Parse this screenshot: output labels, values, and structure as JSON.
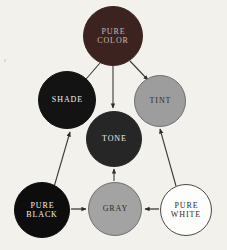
{
  "diagram": {
    "background_color": "#f3f1ec",
    "margin_mark": "r",
    "nodes": [
      {
        "id": "pure-color",
        "label": "PURE\nCOLOR",
        "fill": "#3c2320",
        "text_color": "#c8b8b0",
        "stroke": "#3c2320",
        "cx": 113,
        "cy": 36,
        "r": 30
      },
      {
        "id": "shade",
        "label": "SHADE",
        "fill": "#131313",
        "text_color": "#efefef",
        "stroke": "#131313",
        "cx": 67,
        "cy": 100,
        "r": 29
      },
      {
        "id": "tint",
        "label": "TINT",
        "fill": "#9d9d9d",
        "text_color": "#2b2b2b",
        "stroke": "#6f6f6f",
        "cx": 160,
        "cy": 101,
        "r": 26
      },
      {
        "id": "tone",
        "label": "TONE",
        "fill": "#262626",
        "text_color": "#efefef",
        "stroke": "#262626",
        "cx": 114,
        "cy": 139,
        "r": 28
      },
      {
        "id": "pure-black",
        "label": "PURE\nBLACK",
        "fill": "#0d0d0d",
        "text_color": "#f2f2f2",
        "stroke": "#0d0d0d",
        "cx": 42,
        "cy": 210,
        "r": 28
      },
      {
        "id": "gray",
        "label": "GRAY",
        "fill": "#a3a3a3",
        "text_color": "#2b2b2b",
        "stroke": "#6f6f6f",
        "cx": 115,
        "cy": 209,
        "r": 27
      },
      {
        "id": "pure-white",
        "label": "PURE\nWHITE",
        "fill": "#fdfdfb",
        "text_color": "#2b2b2b",
        "stroke": "#4a4a4a",
        "cx": 186,
        "cy": 210,
        "r": 26
      }
    ],
    "edges": [
      {
        "id": "pure-color-to-shade",
        "from": "pure-color",
        "to": "shade",
        "x1": 100,
        "y1": 63,
        "x2": 80,
        "y2": 86,
        "color": "#3a3a3a"
      },
      {
        "id": "pure-color-to-tone",
        "from": "pure-color",
        "to": "tone",
        "x1": 113,
        "y1": 66,
        "x2": 113,
        "y2": 108,
        "color": "#3a3a3a"
      },
      {
        "id": "pure-color-to-tint",
        "from": "pure-color",
        "to": "tint",
        "x1": 130,
        "y1": 61,
        "x2": 148,
        "y2": 80,
        "color": "#3a3a3a"
      },
      {
        "id": "pure-black-to-shade",
        "from": "pure-black",
        "to": "shade",
        "x1": 54,
        "y1": 187,
        "x2": 70,
        "y2": 132,
        "color": "#3a3a3a"
      },
      {
        "id": "gray-to-tone",
        "from": "gray",
        "to": "tone",
        "x1": 114,
        "y1": 181,
        "x2": 114,
        "y2": 169,
        "color": "#3a3a3a"
      },
      {
        "id": "pure-white-to-tint",
        "from": "pure-white",
        "to": "tint",
        "x1": 176,
        "y1": 186,
        "x2": 160,
        "y2": 129,
        "color": "#3a3a3a"
      },
      {
        "id": "pure-black-to-gray",
        "from": "pure-black",
        "to": "gray",
        "x1": 71,
        "y1": 209,
        "x2": 86,
        "y2": 209,
        "color": "#1c1c1c"
      },
      {
        "id": "pure-white-to-gray",
        "from": "pure-white",
        "to": "gray",
        "x1": 159,
        "y1": 209,
        "x2": 145,
        "y2": 209,
        "color": "#1c1c1c"
      }
    ]
  }
}
